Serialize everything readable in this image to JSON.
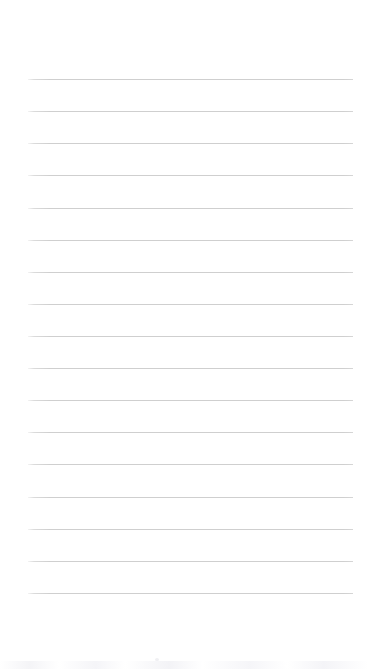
{
  "page": {
    "kind": "scanned-lined-paper",
    "width": 368,
    "height": 669,
    "background_color": "#ffffff",
    "text_content": "",
    "has_handwriting": false,
    "has_printed_text": false,
    "notes_label": ""
  },
  "ruling": {
    "line_count": 17,
    "line_color": "#cfcfcf",
    "line_thickness_px": 1,
    "line_left_x": 28,
    "line_right_x": 353,
    "line_length_px": 325,
    "first_line_y": 79,
    "last_line_y": 593,
    "line_spacing_px": 32.1,
    "line_ys": [
      79,
      111,
      143,
      175,
      208,
      240,
      272,
      304,
      336,
      368,
      400,
      432,
      464,
      497,
      529,
      561,
      593
    ]
  },
  "margins": {
    "top_px": 79,
    "bottom_px": 76,
    "left_px": 28,
    "right_px": 15,
    "top_label": "",
    "bottom_label": ""
  },
  "artifacts": {
    "scan_noise_label": "",
    "speck_label": ""
  }
}
